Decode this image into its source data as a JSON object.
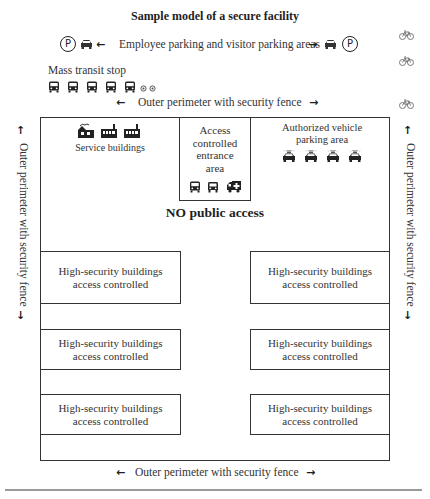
{
  "title": "Sample model of a secure facility",
  "parking": {
    "label": "Employee parking and visitor parking areas",
    "left_icons": [
      "parking-sign-icon",
      "car-icon",
      "arrow-left-icon"
    ],
    "right_icons": [
      "arrow-right-icon",
      "car-icon",
      "parking-sign-icon"
    ],
    "parking_symbol": "P"
  },
  "transit": {
    "label": "Mass transit stop",
    "bus_count": 5,
    "extra_icons": [
      "small-circle-icon",
      "small-circle-icon"
    ]
  },
  "perimeter": {
    "top_label": "Outer perimeter with security fence",
    "bottom_label": "Outer perimeter with security fence",
    "left_label": "Outer perimeter with security fence",
    "right_label": "Outer perimeter with security fence",
    "arrow_left": "←",
    "arrow_right": "→",
    "arrow_up": "↑",
    "arrow_down": "↓"
  },
  "bicycles": {
    "count": 3,
    "glyph": "⚲"
  },
  "service_buildings": {
    "label": "Service buildings",
    "icons": [
      "factory-icon",
      "factory-icon",
      "factory-icon"
    ]
  },
  "entrance": {
    "label_lines": [
      "Access",
      "controlled",
      "entrance",
      "area"
    ],
    "icons": [
      "bus-icon",
      "bus-icon",
      "ambulance-icon"
    ]
  },
  "authorized_parking": {
    "label_lines": [
      "Authorized vehicle",
      "parking area"
    ],
    "vehicle_count": 4
  },
  "center_label": "NO public access",
  "high_security_buildings": [
    {
      "line1": "High-security buildings",
      "line2": "access controlled",
      "side": "left",
      "row": 1
    },
    {
      "line1": "High-security buildings",
      "line2": "access controlled",
      "side": "right",
      "row": 1
    },
    {
      "line1": "High-security buildings",
      "line2": "access controlled",
      "side": "left",
      "row": 2
    },
    {
      "line1": "High-security buildings",
      "line2": "access controlled",
      "side": "right",
      "row": 2
    },
    {
      "line1": "High-security buildings",
      "line2": "access controlled",
      "side": "left",
      "row": 3
    },
    {
      "line1": "High-security buildings",
      "line2": "access controlled",
      "side": "right",
      "row": 3
    }
  ],
  "colors": {
    "line": "#333333",
    "text": "#2b2b2b",
    "bicycle": "#777777",
    "rule": "#9a9a9a"
  }
}
